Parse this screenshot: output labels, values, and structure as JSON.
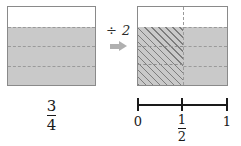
{
  "figure": {
    "colors": {
      "shade_fill": "#c9c9c9",
      "hatch_line": "#7d7d7d",
      "outline": "#8a8a8a",
      "dashed_line": "#9a9a9a",
      "arrow": "#b0b0b0",
      "text": "#1a1a1a",
      "background": "#ffffff"
    }
  },
  "left_model": {
    "name": "three-quarters-area-model",
    "total_parts": 4,
    "shaded_parts": 3,
    "bands": [
      {
        "index": 0,
        "shaded": false
      },
      {
        "index": 1,
        "shaded": true
      },
      {
        "index": 2,
        "shaded": true
      },
      {
        "index": 3,
        "shaded": true
      }
    ]
  },
  "operator": {
    "symbol": "÷ 2",
    "arrow": "right-arrow"
  },
  "right_model": {
    "name": "three-eighths-area-model",
    "total_parts": 8,
    "hatched_parts": 3,
    "vertical_split_at": 0.5,
    "bands": [
      {
        "index": 0,
        "shaded": false
      },
      {
        "index": 1,
        "shaded": true
      },
      {
        "index": 2,
        "shaded": true
      },
      {
        "index": 3,
        "shaded": true
      }
    ]
  },
  "left_fraction": {
    "numerator": "3",
    "denominator": "4"
  },
  "number_line": {
    "ticks": [
      {
        "position": 0.0,
        "label_numerator": "0",
        "label_denominator": ""
      },
      {
        "position": 0.5,
        "label_numerator": "1",
        "label_denominator": "2"
      },
      {
        "position": 1.0,
        "label_numerator": "1",
        "label_denominator": ""
      }
    ]
  },
  "chart_data": {
    "type": "bar",
    "title": "",
    "categories": [
      "3/4 area model",
      "3/4 ÷ 2 area model"
    ],
    "values": [
      0.75,
      0.375
    ],
    "series": [
      {
        "name": "shaded fraction of whole",
        "values": [
          0.75,
          0.375
        ]
      }
    ],
    "annotations": [
      "÷ 2",
      "3/4"
    ],
    "xlabel": "",
    "ylabel": "",
    "ylim": [
      0,
      1
    ],
    "axis_ticks": [
      "0",
      "1/2",
      "1"
    ],
    "grid": false,
    "legend": "none"
  }
}
